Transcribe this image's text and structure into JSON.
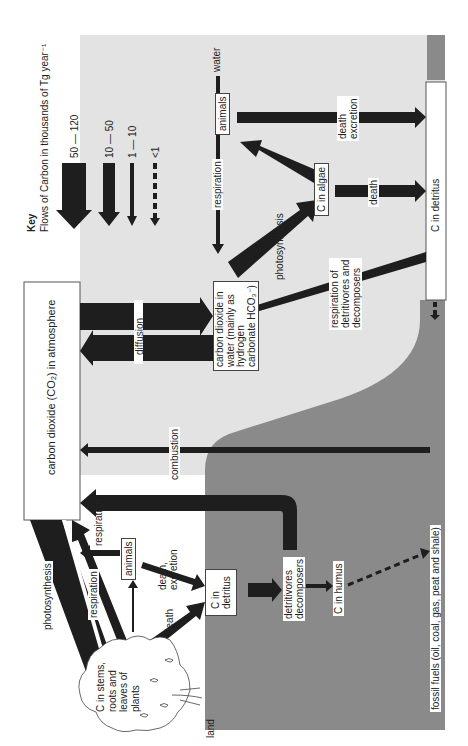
{
  "key": {
    "title": "Key",
    "subtitle": "Flows of Carbon in thousands of Tg year⁻¹",
    "entries": [
      {
        "label": "50 — 120",
        "style": "very-thick-arrow"
      },
      {
        "label": "10 — 50",
        "style": "thick-arrow"
      },
      {
        "label": "1 — 10",
        "style": "thin-arrow"
      },
      {
        "label": "<1",
        "style": "dashed-arrow"
      }
    ]
  },
  "regions": {
    "water": "water",
    "land": "land"
  },
  "nodes": {
    "atmosphere": "carbon dioxide (CO₂) in atmosphere",
    "water_co2": "carbon dioxide in\nwater (mainly as\nhydrogen\ncarbonate HCO₃⁻)",
    "water_animals": "animals",
    "algae": "C in algae",
    "water_detritus": "C in detritus",
    "plants": "C in stems,\nroots and\nleaves of\nplants",
    "land_animals": "animals",
    "land_detritus": "C in\ndetritus",
    "decomposers": "detritivores\ndecomposers",
    "humus": "C in humus",
    "fossil_fuels": "fossil fuels (oil, coal, gas, peat and shale)"
  },
  "flows": {
    "diffusion": "diffusion",
    "combustion": "combustion",
    "water_respiration": "respiration",
    "water_photosynthesis": "photosynthesis",
    "water_death_excretion": "death\nexcretion",
    "algae_death": "death",
    "respiration_decomposers": "respiration of\ndetritivores and\ndecomposers",
    "land_photosynthesis": "photosynthesis",
    "land_plant_respiration": "respiration",
    "land_animal_respiration": "respiration",
    "land_death_excretion": "death,\nexcretion",
    "land_plant_death": "death"
  },
  "colors": {
    "arrow": "#1e1e1e",
    "water": "#e3e3e3",
    "land": "#8a8a8a",
    "box": "#ffffff"
  }
}
